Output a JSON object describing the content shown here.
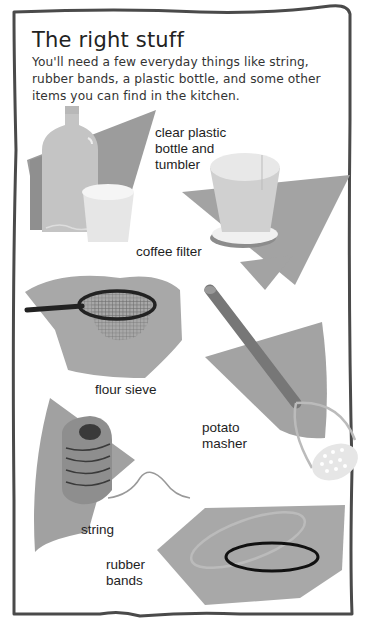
{
  "header": {
    "title": "The right stuff",
    "intro": "You'll need a few everyday things like string, rubber bands, a plastic bottle, and some other items you can find in the kitchen."
  },
  "items": [
    {
      "id": "bottle",
      "label_lines": [
        "clear plastic",
        "bottle and",
        "tumbler"
      ]
    },
    {
      "id": "coffee-filter",
      "label_lines": [
        "coffee filter"
      ]
    },
    {
      "id": "flour-sieve",
      "label_lines": [
        "flour sieve"
      ]
    },
    {
      "id": "potato-masher",
      "label_lines": [
        "potato",
        "masher"
      ]
    },
    {
      "id": "string",
      "label_lines": [
        "string"
      ]
    },
    {
      "id": "rubber-bands",
      "label_lines": [
        "rubber",
        "bands"
      ]
    }
  ],
  "colors": {
    "frame": "#4a4a4a",
    "backdrop": "#a9a9a9",
    "backdrop_dark": "#8f8f8f",
    "object_light": "#d4d4d4",
    "object_white": "#efefef",
    "ink": "#1e1e1e"
  }
}
